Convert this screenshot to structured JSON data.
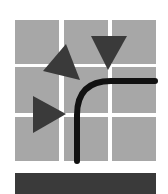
{
  "logo": {
    "grid": {
      "rows": 3,
      "cols": 3,
      "tile_color": "#a7a7a7",
      "tiles": [
        {
          "x": 15,
          "y": 20,
          "w": 44,
          "h": 44
        },
        {
          "x": 64,
          "y": 20,
          "w": 44,
          "h": 44
        },
        {
          "x": 112,
          "y": 20,
          "w": 44,
          "h": 44
        },
        {
          "x": 15,
          "y": 67,
          "w": 44,
          "h": 46
        },
        {
          "x": 64,
          "y": 67,
          "w": 44,
          "h": 46
        },
        {
          "x": 112,
          "y": 67,
          "w": 44,
          "h": 46
        },
        {
          "x": 15,
          "y": 117,
          "w": 44,
          "h": 44
        },
        {
          "x": 64,
          "y": 117,
          "w": 44,
          "h": 44
        },
        {
          "x": 112,
          "y": 117,
          "w": 44,
          "h": 44
        }
      ]
    },
    "triangles": [
      {
        "name": "triangle-up-left",
        "points": "66,44 80,80 43,71",
        "color": "#3a3a3a"
      },
      {
        "name": "triangle-down",
        "points": "91,36 127,36 108,70",
        "color": "#3a3a3a"
      },
      {
        "name": "triangle-right",
        "points": "33,96 66,114 33,133",
        "color": "#3a3a3a"
      }
    ],
    "curve": {
      "path": "M 77 161 L 77 115 Q 77 81 111 81 L 155 81",
      "color": "#111111",
      "stroke_width": 6
    },
    "bottom_bar": {
      "color": "#3a3a3a"
    }
  }
}
